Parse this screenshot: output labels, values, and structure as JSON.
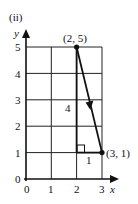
{
  "figure": {
    "part_label": "(ii)",
    "x_axis_label": "x",
    "y_axis_label": "y",
    "x_ticks": [
      "0",
      "1",
      "2",
      "3"
    ],
    "y_ticks": [
      "0",
      "1",
      "2",
      "3",
      "4",
      "5"
    ],
    "points": [
      {
        "label": "(2, 5)",
        "x": 2,
        "y": 5
      },
      {
        "label": "(3, 1)",
        "x": 3,
        "y": 1
      }
    ],
    "vertical_leg_label": "4",
    "horizontal_leg_label": "1",
    "line_color": "#111111",
    "grid_color": "#222222"
  }
}
